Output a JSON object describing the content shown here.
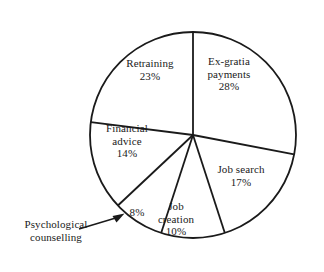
{
  "chart_data": {
    "type": "pie",
    "title": "",
    "subtitle": "",
    "xlabel": "",
    "ylabel": "",
    "legend_position": "none",
    "grid": false,
    "units": "percent",
    "start_angle_deg": 0,
    "direction": "clockwise",
    "categories": [
      "Ex-gratia payments",
      "Job search",
      "Job creation",
      "Psychological counselling",
      "Financial advice",
      "Retraining"
    ],
    "values": [
      28,
      17,
      10,
      8,
      14,
      23
    ],
    "slices": [
      {
        "name": "Ex-gratia payments",
        "label_lines": [
          "Ex-gratia",
          "payments"
        ],
        "value": 28,
        "value_label": "28%",
        "start_deg": 0,
        "end_deg": 100.8,
        "fill": "#ffffff",
        "stroke": "#1a1a1a"
      },
      {
        "name": "Job search",
        "label_lines": [
          "Job search"
        ],
        "value": 17,
        "value_label": "17%",
        "start_deg": 100.8,
        "end_deg": 162.0,
        "fill": "#ffffff",
        "stroke": "#1a1a1a"
      },
      {
        "name": "Job creation",
        "label_lines": [
          "Job",
          "creation"
        ],
        "value": 10,
        "value_label": "10%",
        "start_deg": 162.0,
        "end_deg": 198.0,
        "fill": "#ffffff",
        "stroke": "#1a1a1a"
      },
      {
        "name": "Psychological counselling",
        "label_lines": [
          "Psychological",
          "counselling"
        ],
        "value": 8,
        "value_label": "8%",
        "start_deg": 198.0,
        "end_deg": 226.8,
        "fill": "#ffffff",
        "stroke": "#1a1a1a",
        "callout": true
      },
      {
        "name": "Financial advice",
        "label_lines": [
          "Financial",
          "advice"
        ],
        "value": 14,
        "value_label": "14%",
        "start_deg": 226.8,
        "end_deg": 277.2,
        "fill": "#ffffff",
        "stroke": "#1a1a1a"
      },
      {
        "name": "Retraining",
        "label_lines": [
          "Retraining"
        ],
        "value": 23,
        "value_label": "23%",
        "start_deg": 277.2,
        "end_deg": 360.0,
        "fill": "#ffffff",
        "stroke": "#1a1a1a"
      }
    ]
  },
  "labels": {
    "ex_gratia_name_line1": "Ex-gratia",
    "ex_gratia_name_line2": "payments",
    "ex_gratia_value": "28%",
    "retraining_name": "Retraining",
    "retraining_value": "23%",
    "job_search_name": "Job search",
    "job_search_value": "17%",
    "job_creation_name_line1": "Job",
    "job_creation_name_line2": "creation",
    "job_creation_value": "10%",
    "financial_name_line1": "Financial",
    "financial_name_line2": "advice",
    "financial_value": "14%",
    "psych_value": "8%",
    "psych_name_line1": "Psychological",
    "psych_name_line2": "counselling"
  },
  "style": {
    "background": "#ffffff",
    "line_color": "#1a1a1a",
    "text_color": "#1a1a1a",
    "slice_fill": "#ffffff"
  }
}
